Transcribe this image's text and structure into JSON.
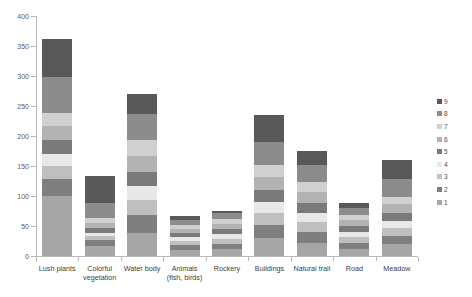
{
  "chart_data": {
    "type": "bar",
    "stacked": true,
    "title": "",
    "xlabel": "",
    "ylabel": "",
    "ylim": [
      0,
      400
    ],
    "ytick_step": 50,
    "ytick_labels": [
      "0",
      "50",
      "100",
      "150",
      "200",
      "250",
      "300",
      "350",
      "400"
    ],
    "grid": false,
    "legend_position": "right",
    "categories": [
      "Lush plants",
      "Colorful vegetation",
      "Water body",
      "Animals (fish, birds)",
      "Rockery",
      "Buildings",
      "Natural trail",
      "Road",
      "Meadow"
    ],
    "series": [
      {
        "name": "1",
        "color": "#a6a6a6",
        "values": [
          100,
          17,
          38,
          10,
          11,
          30,
          22,
          12,
          20
        ]
      },
      {
        "name": "2",
        "color": "#7f7f7f",
        "values": [
          28,
          9,
          30,
          8,
          9,
          22,
          18,
          10,
          14
        ]
      },
      {
        "name": "3",
        "color": "#bfbfbf",
        "values": [
          22,
          7,
          26,
          7,
          8,
          20,
          16,
          9,
          13
        ]
      },
      {
        "name": "4",
        "color": "#e8e8e8",
        "values": [
          20,
          6,
          22,
          6,
          8,
          18,
          15,
          9,
          12
        ]
      },
      {
        "name": "5",
        "color": "#7a7a7a",
        "values": [
          24,
          8,
          24,
          7,
          9,
          20,
          17,
          10,
          13
        ]
      },
      {
        "name": "6",
        "color": "#b3b3b3",
        "values": [
          23,
          8,
          26,
          7,
          9,
          22,
          18,
          10,
          14
        ]
      },
      {
        "name": "7",
        "color": "#d0d0d0",
        "values": [
          22,
          8,
          28,
          7,
          8,
          20,
          17,
          9,
          13
        ]
      },
      {
        "name": "8",
        "color": "#8c8c8c",
        "values": [
          60,
          25,
          42,
          8,
          9,
          38,
          28,
          11,
          30
        ]
      },
      {
        "name": "9",
        "color": "#595959",
        "values": [
          63,
          45,
          34,
          7,
          4,
          45,
          24,
          8,
          31
        ]
      }
    ],
    "totals": [
      362,
      133,
      270,
      67,
      75,
      235,
      175,
      88,
      160
    ]
  },
  "legend": {
    "items": [
      {
        "label": "9",
        "color": "#595959"
      },
      {
        "label": "8",
        "color": "#8c8c8c"
      },
      {
        "label": "7",
        "color": "#d0d0d0"
      },
      {
        "label": "6",
        "color": "#b3b3b3"
      },
      {
        "label": "5",
        "color": "#7a7a7a"
      },
      {
        "label": "4",
        "color": "#e8e8e8"
      },
      {
        "label": "3",
        "color": "#bfbfbf"
      },
      {
        "label": "2",
        "color": "#7f7f7f"
      },
      {
        "label": "1",
        "color": "#a6a6a6"
      }
    ]
  },
  "colors": {
    "axis": "#b8b8b8",
    "tick_text": "#5a5a5a",
    "category_text": "#404040",
    "background": "#ffffff"
  }
}
